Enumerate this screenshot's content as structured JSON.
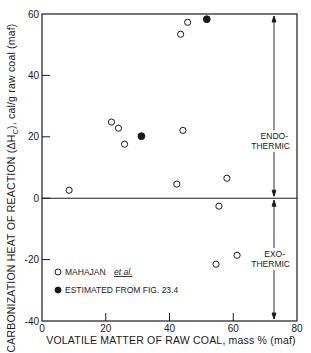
{
  "chart_data": {
    "type": "scatter",
    "title": "",
    "xlabel": "VOLATILE MATTER OF RAW COAL, mass % (maf)",
    "ylabel": "CARBONIZATION HEAT OF REACTION (ΔH_C), cal/g raw coal (maf)",
    "ylabel_main": "CARBONIZATION HEAT OF REACTION (ΔH",
    "ylabel_sub": "C",
    "ylabel_tail": "), cal/g raw coal (maf)",
    "xlim": [
      0,
      80
    ],
    "ylim": [
      -40,
      60
    ],
    "xticks": [
      0,
      20,
      40,
      60,
      80
    ],
    "yticks": [
      -40,
      -20,
      0,
      20,
      40,
      60
    ],
    "grid": false,
    "reference_line": {
      "y": 0
    },
    "series": [
      {
        "name": "MAHAJAN et al.",
        "marker": "open-circle",
        "points": [
          {
            "x": 8.5,
            "y": 2.6
          },
          {
            "x": 21.8,
            "y": 24.8
          },
          {
            "x": 24.0,
            "y": 22.8
          },
          {
            "x": 25.9,
            "y": 17.6
          },
          {
            "x": 42.3,
            "y": 4.6
          },
          {
            "x": 43.5,
            "y": 53.4
          },
          {
            "x": 44.2,
            "y": 22.1
          },
          {
            "x": 45.7,
            "y": 57.3
          },
          {
            "x": 54.6,
            "y": -21.5
          },
          {
            "x": 55.5,
            "y": -2.6
          },
          {
            "x": 58.0,
            "y": 6.5
          },
          {
            "x": 61.2,
            "y": -18.6
          }
        ]
      },
      {
        "name": "ESTIMATED FROM FIG. 23.4",
        "marker": "filled-circle",
        "points": [
          {
            "x": 31.2,
            "y": 20.2
          },
          {
            "x": 51.7,
            "y": 58.3
          }
        ]
      }
    ],
    "legend": {
      "position": "lower-left",
      "entries": [
        {
          "label_main": "MAHAJAN",
          "label_italic": "et al.",
          "marker": "open-circle"
        },
        {
          "label_main": "ESTIMATED FROM FIG. 23.4",
          "label_italic": "",
          "marker": "filled-circle"
        }
      ]
    },
    "annotations": [
      {
        "text_line1": "ENDO-",
        "text_line2": "THERMIC",
        "region": "y > 0",
        "arrow": "double-headed, from 0 up to 60"
      },
      {
        "text_line1": "EXO-",
        "text_line2": "THERMIC",
        "region": "y < 0",
        "arrow": "double-headed, from 0 down to -40"
      }
    ]
  },
  "colors": {
    "ink": "#1a1a1a",
    "background": "#ffffff"
  }
}
